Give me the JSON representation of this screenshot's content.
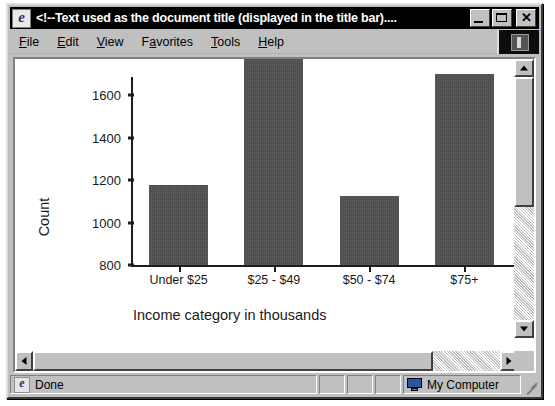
{
  "window": {
    "title": "<!--Text used as the document title (displayed in the title bar)....",
    "icon": "ie-logo-icon",
    "minimize_label": "",
    "maximize_label": "",
    "close_label": "✕"
  },
  "menu": {
    "items": [
      {
        "label": "File",
        "accel": "F"
      },
      {
        "label": "Edit",
        "accel": "E"
      },
      {
        "label": "View",
        "accel": "V"
      },
      {
        "label": "Favorites",
        "accel": "a"
      },
      {
        "label": "Tools",
        "accel": "T"
      },
      {
        "label": "Help",
        "accel": "H"
      }
    ]
  },
  "statusbar": {
    "message": "Done",
    "zone": "My Computer",
    "panel_2": "",
    "panel_3": "",
    "panel_4": ""
  },
  "colors": {
    "bar_fill": "#4a4a4a",
    "axis": "#1d1d1d",
    "window_face": "#c0c0c0",
    "titlebar": "#000000",
    "plot_background": "#ffffff"
  },
  "chart_data": {
    "type": "bar",
    "title": "",
    "categories": [
      "Under $25",
      "$25 - $49",
      "$50 - $74",
      "$75+"
    ],
    "values": [
      1175,
      1790,
      1125,
      1700
    ],
    "xlabel": "Income category in thousands",
    "ylabel": "Count",
    "yticks": [
      800,
      1000,
      1200,
      1400,
      1600
    ],
    "ytick_labels": [
      "800",
      "1000",
      "1200",
      "1400",
      "1600"
    ],
    "ylim": [
      800,
      1600
    ],
    "grid": false,
    "legend": false,
    "note": "Second and fourth bars extend above the visible viewport; chart is clipped by the browser scroll area."
  }
}
